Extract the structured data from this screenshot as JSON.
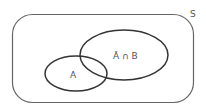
{
  "diagram": {
    "type": "venn",
    "universe": {
      "label": "S"
    },
    "sets": [
      {
        "id": "A",
        "label": "A"
      },
      {
        "id": "notA_and_B",
        "label": "Ā ∩ B"
      }
    ],
    "colors": {
      "stroke": "#333333",
      "universe_stroke": "#666666",
      "text": "#555555",
      "background": "#ffffff"
    }
  }
}
